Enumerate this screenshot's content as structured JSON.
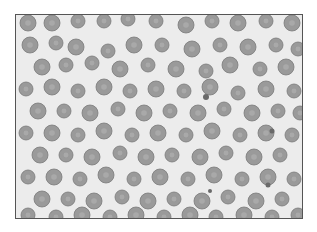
{
  "image": {
    "subject": "blood smear micrograph",
    "background_color": "#ececec",
    "cell_color": "#9a9a9a",
    "cell_edge_color": "#7a7a7a",
    "cell_center_color": "#b4b4b4",
    "dot_color": "#6a6a6a"
  },
  "cells": [
    [
      12,
      8,
      8
    ],
    [
      36,
      8,
      8
    ],
    [
      62,
      6,
      7
    ],
    [
      88,
      6,
      7
    ],
    [
      112,
      4,
      7
    ],
    [
      140,
      6,
      7
    ],
    [
      170,
      10,
      8
    ],
    [
      196,
      6,
      7
    ],
    [
      222,
      8,
      8
    ],
    [
      250,
      6,
      7
    ],
    [
      276,
      8,
      8
    ],
    [
      14,
      30,
      8
    ],
    [
      40,
      28,
      7
    ],
    [
      60,
      32,
      8
    ],
    [
      92,
      36,
      7
    ],
    [
      118,
      30,
      8
    ],
    [
      146,
      30,
      7
    ],
    [
      176,
      34,
      8
    ],
    [
      204,
      30,
      7
    ],
    [
      232,
      32,
      8
    ],
    [
      260,
      30,
      7
    ],
    [
      282,
      34,
      7
    ],
    [
      26,
      52,
      8
    ],
    [
      50,
      50,
      7
    ],
    [
      76,
      48,
      7
    ],
    [
      104,
      54,
      8
    ],
    [
      132,
      50,
      7
    ],
    [
      160,
      54,
      8
    ],
    [
      190,
      56,
      7
    ],
    [
      214,
      50,
      8
    ],
    [
      244,
      54,
      7
    ],
    [
      270,
      52,
      8
    ],
    [
      10,
      74,
      7
    ],
    [
      36,
      72,
      8
    ],
    [
      62,
      76,
      7
    ],
    [
      88,
      72,
      8
    ],
    [
      114,
      76,
      7
    ],
    [
      140,
      74,
      8
    ],
    [
      168,
      76,
      7
    ],
    [
      194,
      72,
      8
    ],
    [
      222,
      78,
      7
    ],
    [
      250,
      74,
      8
    ],
    [
      278,
      76,
      7
    ],
    [
      22,
      96,
      8
    ],
    [
      48,
      96,
      7
    ],
    [
      74,
      98,
      8
    ],
    [
      102,
      94,
      7
    ],
    [
      128,
      98,
      8
    ],
    [
      154,
      96,
      7
    ],
    [
      182,
      98,
      8
    ],
    [
      208,
      94,
      7
    ],
    [
      236,
      98,
      8
    ],
    [
      262,
      96,
      7
    ],
    [
      284,
      98,
      7
    ],
    [
      10,
      118,
      7
    ],
    [
      36,
      118,
      8
    ],
    [
      62,
      120,
      7
    ],
    [
      88,
      116,
      8
    ],
    [
      116,
      120,
      7
    ],
    [
      142,
      118,
      8
    ],
    [
      170,
      120,
      7
    ],
    [
      196,
      116,
      8
    ],
    [
      224,
      120,
      7
    ],
    [
      250,
      118,
      8
    ],
    [
      276,
      120,
      7
    ],
    [
      24,
      140,
      8
    ],
    [
      50,
      140,
      7
    ],
    [
      76,
      142,
      8
    ],
    [
      104,
      138,
      7
    ],
    [
      130,
      142,
      8
    ],
    [
      156,
      140,
      7
    ],
    [
      184,
      142,
      8
    ],
    [
      210,
      138,
      7
    ],
    [
      238,
      142,
      8
    ],
    [
      264,
      140,
      7
    ],
    [
      12,
      162,
      7
    ],
    [
      38,
      162,
      8
    ],
    [
      64,
      164,
      7
    ],
    [
      90,
      160,
      8
    ],
    [
      118,
      164,
      7
    ],
    [
      144,
      162,
      8
    ],
    [
      172,
      164,
      7
    ],
    [
      198,
      160,
      8
    ],
    [
      226,
      164,
      7
    ],
    [
      252,
      162,
      8
    ],
    [
      278,
      164,
      7
    ],
    [
      26,
      184,
      8
    ],
    [
      52,
      184,
      7
    ],
    [
      78,
      186,
      8
    ],
    [
      106,
      182,
      7
    ],
    [
      132,
      186,
      8
    ],
    [
      158,
      184,
      7
    ],
    [
      186,
      186,
      8
    ],
    [
      212,
      182,
      7
    ],
    [
      240,
      186,
      8
    ],
    [
      266,
      184,
      7
    ],
    [
      12,
      200,
      7
    ],
    [
      40,
      202,
      7
    ],
    [
      66,
      200,
      8
    ],
    [
      94,
      202,
      7
    ],
    [
      120,
      200,
      8
    ],
    [
      148,
      202,
      7
    ],
    [
      174,
      200,
      8
    ],
    [
      200,
      202,
      7
    ],
    [
      228,
      200,
      8
    ],
    [
      256,
      202,
      7
    ],
    [
      282,
      200,
      7
    ]
  ],
  "dots": [
    [
      190,
      82,
      3
    ],
    [
      256,
      116,
      2.5
    ],
    [
      252,
      170,
      2.5
    ],
    [
      194,
      176,
      2
    ]
  ]
}
